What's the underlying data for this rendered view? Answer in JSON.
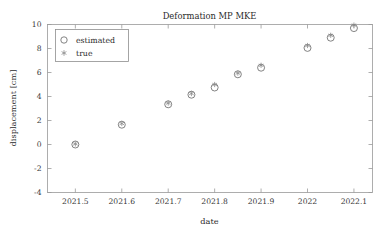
{
  "chart_data": {
    "type": "scatter",
    "title": "Deformation MP MKE",
    "xlabel": "date",
    "ylabel": "displacement [cm]",
    "xlim": [
      2021.44,
      2022.14
    ],
    "ylim": [
      -4,
      10
    ],
    "xticks": [
      2021.5,
      2021.6,
      2021.7,
      2021.8,
      2021.9,
      2022,
      2022.1
    ],
    "xticklabels": [
      "2021.5",
      "2021.6",
      "2021.7",
      "2021.8",
      "2021.9",
      "2022",
      "2022.1"
    ],
    "yticks": [
      -4,
      -2,
      0,
      2,
      4,
      6,
      8,
      10
    ],
    "yticklabels": [
      "-4",
      "-2",
      "0",
      "2",
      "4",
      "6",
      "8",
      "10"
    ],
    "grid": false,
    "legend_position": "upper left",
    "legend_entries": [
      {
        "label": "estimated",
        "marker": "circle-open-marker"
      },
      {
        "label": "true",
        "marker": "asterisk-marker"
      }
    ],
    "x": [
      2021.5,
      2021.6,
      2021.7,
      2021.75,
      2021.8,
      2021.85,
      2021.9,
      2022.0,
      2022.05,
      2022.1
    ],
    "series": [
      {
        "name": "estimated",
        "marker": "circle-open-marker",
        "color": "#6d6d6d",
        "values": [
          0.0,
          1.65,
          3.35,
          4.15,
          4.75,
          5.85,
          6.4,
          8.05,
          8.9,
          9.7
        ]
      },
      {
        "name": "true",
        "marker": "asterisk-marker",
        "color": "#8a8a8a",
        "values": [
          0.05,
          1.75,
          3.45,
          4.25,
          5.0,
          5.95,
          6.6,
          8.25,
          9.1,
          9.95
        ]
      }
    ]
  },
  "figure": {
    "background_color": "#ffffff",
    "frame_color": "#9a9a9a"
  }
}
